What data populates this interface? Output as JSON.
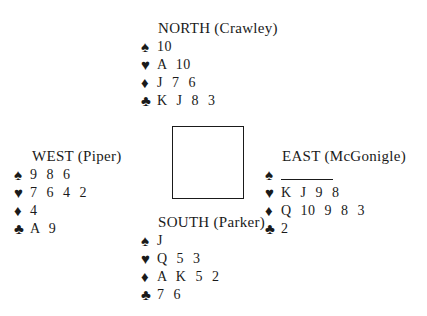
{
  "hands": {
    "north": {
      "title": "NORTH (Crawley)",
      "spades": "10",
      "hearts": "A 10",
      "diamonds": "J 7 6",
      "clubs": "K J 8 3"
    },
    "west": {
      "title": "WEST (Piper)",
      "spades": "9 8 6",
      "hearts": "7 6 4 2",
      "diamonds": "4",
      "clubs": "A 9"
    },
    "east": {
      "title": "EAST (McGonigle)",
      "spades": "",
      "spades_void": true,
      "hearts": "K J 9 8",
      "diamonds": "Q 10 9 8 3",
      "clubs": "2"
    },
    "south": {
      "title": "SOUTH (Parker)",
      "spades": "J",
      "hearts": "Q 5 3",
      "diamonds": "A K 5 2",
      "clubs": "7 6"
    }
  },
  "suits": {
    "spades": "♠",
    "hearts": "♥",
    "diamonds": "♦",
    "clubs": "♣"
  }
}
